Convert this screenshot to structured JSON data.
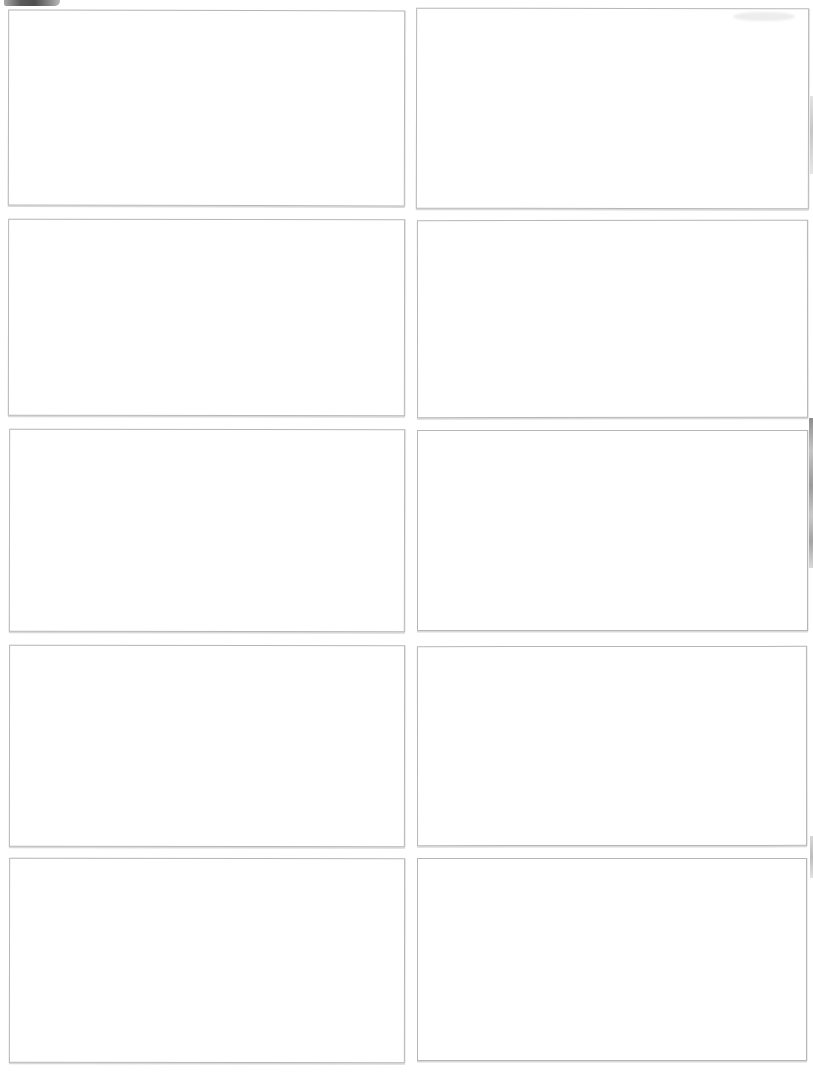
{
  "page": {
    "background": "#ffffff"
  },
  "colors": {
    "page_bg": "#ffffff",
    "card_bg": "#ffffff",
    "card_border": "#b6b6b6",
    "artifact_dark": "#4f4f4f",
    "artifact_light": "#c9c9c9"
  },
  "cards": [
    {
      "id": "blank-card-r1-c1",
      "row": 1,
      "col": 1,
      "text": ""
    },
    {
      "id": "blank-card-r1-c2",
      "row": 1,
      "col": 2,
      "text": ""
    },
    {
      "id": "blank-card-r2-c1",
      "row": 2,
      "col": 1,
      "text": ""
    },
    {
      "id": "blank-card-r2-c2",
      "row": 2,
      "col": 2,
      "text": ""
    },
    {
      "id": "blank-card-r3-c1",
      "row": 3,
      "col": 1,
      "text": ""
    },
    {
      "id": "blank-card-r3-c2",
      "row": 3,
      "col": 2,
      "text": ""
    },
    {
      "id": "blank-card-r4-c1",
      "row": 4,
      "col": 1,
      "text": ""
    },
    {
      "id": "blank-card-r4-c2",
      "row": 4,
      "col": 2,
      "text": ""
    },
    {
      "id": "blank-card-r5-c1",
      "row": 5,
      "col": 1,
      "text": ""
    },
    {
      "id": "blank-card-r5-c2",
      "row": 5,
      "col": 2,
      "text": ""
    }
  ],
  "artifacts": [
    {
      "name": "corner-smudge-top-left"
    },
    {
      "name": "faint-patch-top-right"
    },
    {
      "name": "right-edge-streak-upper"
    },
    {
      "name": "right-edge-streak-middle"
    },
    {
      "name": "right-edge-streak-lower"
    }
  ]
}
